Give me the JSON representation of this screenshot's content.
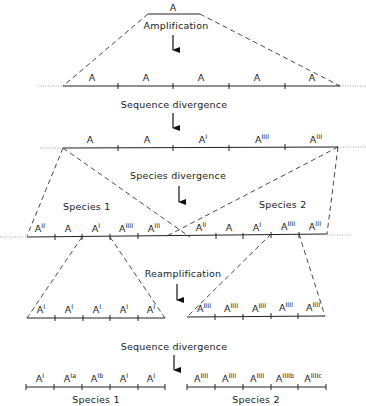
{
  "title_steps": {
    "step1": "Amplification",
    "step2": "Sequence divergence",
    "step3": "Species divergence",
    "step4": "Reamplification",
    "step5": "Sequence divergence"
  },
  "species_labels": {
    "species1": "Species 1",
    "species2": "Species 2"
  },
  "rows": {
    "original": [
      {
        "base": "A",
        "sup": ""
      }
    ],
    "amplified": [
      {
        "base": "A",
        "sup": ""
      },
      {
        "base": "A",
        "sup": ""
      },
      {
        "base": "A",
        "sup": ""
      },
      {
        "base": "A",
        "sup": ""
      },
      {
        "base": "A",
        "sup": ""
      }
    ],
    "diverged": [
      {
        "base": "A",
        "sup": ""
      },
      {
        "base": "A",
        "sup": ""
      },
      {
        "base": "A",
        "sup": "I"
      },
      {
        "base": "A",
        "sup": "IIII"
      },
      {
        "base": "A",
        "sup": "III"
      }
    ],
    "species1_copy": [
      {
        "base": "A",
        "sup": "II"
      },
      {
        "base": "A",
        "sup": ""
      },
      {
        "base": "A",
        "sup": "I"
      },
      {
        "base": "A",
        "sup": "IIII"
      },
      {
        "base": "A",
        "sup": "III"
      }
    ],
    "species2_copy": [
      {
        "base": "A",
        "sup": "II"
      },
      {
        "base": "A",
        "sup": ""
      },
      {
        "base": "A",
        "sup": "I"
      },
      {
        "base": "A",
        "sup": "IIII"
      },
      {
        "base": "A",
        "sup": "III"
      }
    ],
    "species1_reamp": [
      {
        "base": "A",
        "sup": "I"
      },
      {
        "base": "A",
        "sup": "I"
      },
      {
        "base": "A",
        "sup": "I"
      },
      {
        "base": "A",
        "sup": "I"
      },
      {
        "base": "A",
        "sup": "I"
      }
    ],
    "species2_reamp": [
      {
        "base": "A",
        "sup": "IIII"
      },
      {
        "base": "A",
        "sup": "IIII"
      },
      {
        "base": "A",
        "sup": "IIII"
      },
      {
        "base": "A",
        "sup": "IIII"
      },
      {
        "base": "A",
        "sup": "IIII"
      }
    ],
    "species1_final": [
      {
        "base": "A",
        "sup": "I"
      },
      {
        "base": "A",
        "sup": "Ia"
      },
      {
        "base": "A",
        "sup": "Ib"
      },
      {
        "base": "A",
        "sup": "I"
      },
      {
        "base": "A",
        "sup": "I"
      }
    ],
    "species2_final": [
      {
        "base": "A",
        "sup": "IIII"
      },
      {
        "base": "A",
        "sup": "IIII"
      },
      {
        "base": "A",
        "sup": "IIII"
      },
      {
        "base": "A",
        "sup": "IIIIb"
      },
      {
        "base": "A",
        "sup": "IIIIc"
      }
    ]
  }
}
